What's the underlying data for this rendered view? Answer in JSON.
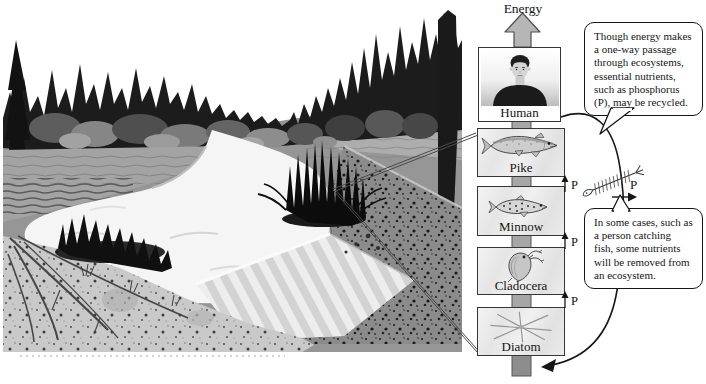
{
  "figure": {
    "energy_label": "Energy",
    "chain": [
      {
        "id": "human",
        "label": "Human"
      },
      {
        "id": "pike",
        "label": "Pike"
      },
      {
        "id": "minnow",
        "label": "Minnow"
      },
      {
        "id": "cladocera",
        "label": "Cladocera"
      },
      {
        "id": "diatom",
        "label": "Diatom"
      }
    ],
    "p_flows": [
      {
        "label": "P"
      },
      {
        "label": "P"
      },
      {
        "label": "P"
      }
    ],
    "removed_p_label": "P",
    "callouts": {
      "recycle": "Though energy makes\na one-way passage\nthrough ecosystems,\nessential nutrients,\nsuch as phosphorus\n(P), may be recycled.",
      "removal": "In some cases, such as\na person catching\nfish, some nutrients\nwill be removed from\nan ecosystem."
    },
    "colors": {
      "arrow_gray": "#b6b6b6",
      "bar_gray": "#a6a6a6",
      "box_border": "#353535",
      "forest_dark": "#1c1c1c",
      "water_light": "#f5f5f5",
      "sediment_gray": "#8b8b8b",
      "soil_light": "#c9c9c9",
      "line_black": "#161616"
    }
  }
}
